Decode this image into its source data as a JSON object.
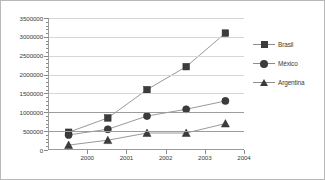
{
  "chart_data": {
    "type": "line",
    "title": "",
    "subtitle": "",
    "xlabel": "",
    "ylabel": "",
    "x": [
      1999.5,
      2000.5,
      2001.5,
      2002.5,
      2003.5
    ],
    "categories": [
      "1999",
      "2000",
      "2001",
      "2002",
      "2003"
    ],
    "xlim": [
      1999,
      2004
    ],
    "ylim": [
      0,
      3500000
    ],
    "grid": true,
    "legend_position": "right",
    "xticks": [
      "2000",
      "2001",
      "2002",
      "2003",
      "2004"
    ],
    "xtick_values": [
      2000,
      2001,
      2002,
      2003,
      2004
    ],
    "yticks": [
      "0",
      "500000",
      "1000000",
      "1500000",
      "2000000",
      "2500000",
      "3000000",
      "3500000"
    ],
    "ytick_values": [
      0,
      500000,
      1000000,
      1500000,
      2000000,
      2500000,
      3000000,
      3500000
    ],
    "series": [
      {
        "name": "Brasil",
        "marker": "square",
        "color": "#3c3c3c",
        "values": [
          470000,
          850000,
          1600000,
          2210000,
          3100000
        ]
      },
      {
        "name": "México",
        "marker": "circle",
        "color": "#3c3c3c",
        "values": [
          400000,
          550000,
          900000,
          1080000,
          1300000
        ]
      },
      {
        "name": "Argentina",
        "marker": "triangle",
        "color": "#3c3c3c",
        "values": [
          130000,
          260000,
          450000,
          450000,
          700000
        ]
      }
    ]
  },
  "legend": {
    "items": [
      {
        "label": "Brasil",
        "marker": "square"
      },
      {
        "label": "México",
        "marker": "circle"
      },
      {
        "label": "Argentina",
        "marker": "triangle"
      }
    ]
  },
  "colors": {
    "marker": "#3c3c3c",
    "line": "#8d8d8d",
    "grid": "#d6d6d6",
    "grid_major": "#9d9d9d",
    "axis": "#9a9a9a",
    "border": "#b8b8b8",
    "text": "#3a3a3a",
    "background": "#ffffff"
  }
}
